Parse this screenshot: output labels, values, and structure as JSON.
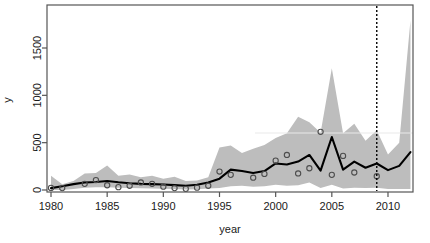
{
  "chart_data": {
    "type": "line",
    "title": "",
    "subtitle": "",
    "xlabel": "year",
    "ylabel": "y",
    "xlim": [
      1978.8,
      1012.2
    ],
    "x_axis_range": [
      1978.8,
      2012.2
    ],
    "ylim": [
      0,
      1950
    ],
    "grid": false,
    "legend_position": "none",
    "x_tick_labels": [
      "1980",
      "1985",
      "1990",
      "1995",
      "2000",
      "2005",
      "2010"
    ],
    "x_ticks": [
      1980,
      1985,
      1990,
      1995,
      2000,
      2005,
      2010
    ],
    "y_tick_labels": [
      "0",
      "500",
      "1000",
      "1500"
    ],
    "y_ticks": [
      0,
      500,
      1000,
      1500
    ],
    "x": [
      1980,
      1981,
      1982,
      1983,
      1984,
      1985,
      1986,
      1987,
      1988,
      1989,
      1990,
      1991,
      1992,
      1993,
      1994,
      1995,
      1996,
      1997,
      1998,
      1999,
      2000,
      2001,
      2002,
      2003,
      2004,
      2005,
      2006,
      2007,
      2008,
      2009,
      2010,
      2011,
      2012
    ],
    "series": [
      {
        "name": "fitted",
        "type": "line",
        "color": "#000000",
        "values": [
          20,
          40,
          62,
          80,
          85,
          95,
          82,
          72,
          65,
          62,
          58,
          52,
          45,
          55,
          80,
          120,
          215,
          200,
          180,
          200,
          280,
          270,
          300,
          370,
          205,
          560,
          215,
          300,
          235,
          280,
          210,
          255,
          400
        ]
      },
      {
        "name": "observed",
        "type": "scatter",
        "marker": "open-circle",
        "color": "#4d4d4d",
        "values": [
          22,
          20,
          null,
          65,
          105,
          50,
          30,
          45,
          80,
          65,
          35,
          20,
          12,
          25,
          45,
          195,
          160,
          null,
          130,
          170,
          310,
          370,
          175,
          230,
          615,
          160,
          360,
          185,
          null,
          145,
          null,
          null,
          null
        ]
      },
      {
        "name": "interval-upper",
        "type": "band-upper",
        "color": "#bdbdbd",
        "values": [
          150,
          60,
          95,
          175,
          180,
          260,
          150,
          165,
          135,
          150,
          120,
          140,
          95,
          100,
          135,
          450,
          470,
          390,
          435,
          475,
          550,
          600,
          775,
          715,
          605,
          1285,
          600,
          700,
          520,
          630,
          375,
          500,
          1790
        ]
      },
      {
        "name": "interval-lower",
        "type": "band-lower",
        "color": "#bdbdbd",
        "values": [
          0,
          0,
          10,
          25,
          30,
          30,
          25,
          20,
          18,
          15,
          12,
          10,
          5,
          8,
          15,
          20,
          40,
          45,
          35,
          40,
          55,
          45,
          50,
          80,
          20,
          55,
          15,
          25,
          20,
          25,
          10,
          10,
          10
        ]
      }
    ],
    "annotations": [
      {
        "name": "forecast-start",
        "type": "vertical-line",
        "x": 2009,
        "style": "dotted",
        "color": "#000000"
      }
    ],
    "band_fill_color": "#bdbdbd",
    "line_color": "#000000",
    "point_stroke_color": "#4d4d4d",
    "frame_color": "#555555",
    "background_color": "#ffffff"
  }
}
